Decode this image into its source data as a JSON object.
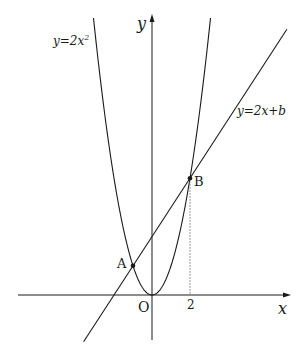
{
  "diagram": {
    "type": "function-graph",
    "curves": [
      {
        "id": "parabola",
        "label": "y=2x²",
        "label_main": "y=2x",
        "label_sup": "2",
        "equation": "y = 2x^2",
        "a": 2
      },
      {
        "id": "line",
        "label": "y=2x+b",
        "equation": "y = 2x + b",
        "slope": 2,
        "intercept_symbol": "b"
      }
    ],
    "axes": {
      "x_label": "x",
      "y_label": "y",
      "origin_label": "O"
    },
    "points": [
      {
        "name": "A",
        "x": -1,
        "y": 2
      },
      {
        "name": "B",
        "x": 2,
        "y": 8
      }
    ],
    "x_ticks": [
      {
        "value": 2,
        "label": "2"
      }
    ],
    "guides": [
      {
        "type": "vertical-dotted",
        "from": "B",
        "to_x_axis_at": 2
      }
    ],
    "colors": {
      "stroke": "#1a1a1a",
      "background": "#ffffff",
      "guide": "#777777"
    }
  }
}
